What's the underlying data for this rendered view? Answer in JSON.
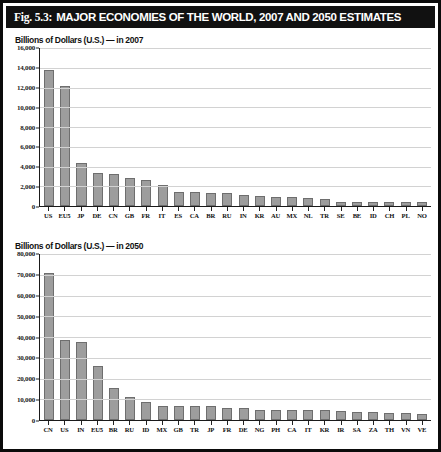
{
  "figure": {
    "number": "Fig. 5.3:",
    "title": "MAJOR ECONOMIES OF THE WORLD, 2007 AND 2050 ESTIMATES",
    "border_color": "#0b0b0b",
    "title_bar_color": "#111111",
    "bar_color": "#9d9d9d",
    "grid_color": "#d2d2d2"
  },
  "chart_data": [
    {
      "type": "bar",
      "title": "Billions of Dollars (U.S.) — in 2007",
      "xlabel": "",
      "ylabel": "Billions of Dollars (U.S.)",
      "ylim": [
        0,
        16000
      ],
      "ytick_step": 2000,
      "ytick_labels": [
        "0",
        "2,000",
        "4,000",
        "6,000",
        "8,000",
        "10,000",
        "12,000",
        "14,000",
        "16,000"
      ],
      "grid": true,
      "legend": "none",
      "categories": [
        "US",
        "EU5",
        "JP",
        "DE",
        "CN",
        "GB",
        "FR",
        "IT",
        "ES",
        "CA",
        "BR",
        "RU",
        "IN",
        "KR",
        "AU",
        "MX",
        "NL",
        "TR",
        "SE",
        "BE",
        "ID",
        "CH",
        "PL",
        "NO"
      ],
      "values": [
        13800,
        12200,
        4400,
        3320,
        3280,
        2800,
        2590,
        2110,
        1440,
        1430,
        1310,
        1290,
        1100,
        970,
        910,
        890,
        770,
        660,
        455,
        450,
        430,
        425,
        420,
        390
      ]
    },
    {
      "type": "bar",
      "title": "Billions of Dollars (U.S.) — in 2050",
      "xlabel": "",
      "ylabel": "Billions of Dollars (U.S.)",
      "ylim": [
        0,
        80000
      ],
      "ytick_step": 10000,
      "ytick_labels": [
        "0",
        "10,000",
        "20,000",
        "30,000",
        "40,000",
        "50,000",
        "60,000",
        "70,000",
        "80,000"
      ],
      "grid": true,
      "legend": "none",
      "categories": [
        "CN",
        "US",
        "IN",
        "EU5",
        "BR",
        "RU",
        "ID",
        "MX",
        "GB",
        "TR",
        "JP",
        "FR",
        "DE",
        "NG",
        "PH",
        "CA",
        "IT",
        "KR",
        "IR",
        "SA",
        "ZA",
        "TH",
        "VN",
        "VE"
      ],
      "values": [
        70700,
        38500,
        37700,
        26200,
        15300,
        11300,
        8600,
        6900,
        6800,
        6700,
        6600,
        5800,
        5700,
        5000,
        4900,
        4800,
        4700,
        4600,
        4300,
        4100,
        3900,
        3500,
        3300,
        3000
      ]
    }
  ]
}
